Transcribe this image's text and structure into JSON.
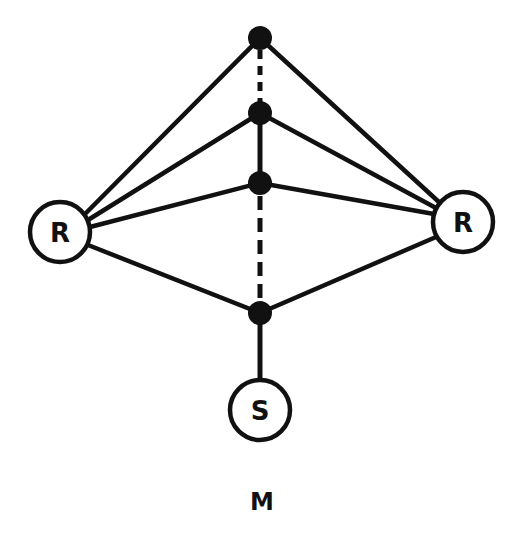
{
  "diagram": {
    "caption": "M",
    "stroke_color": "#111111",
    "background": "#ffffff",
    "circle_nodes": [
      {
        "id": "R_left",
        "label": "R",
        "cx": 60,
        "cy": 232,
        "r": 30
      },
      {
        "id": "R_right",
        "label": "R",
        "cx": 463,
        "cy": 222,
        "r": 30
      },
      {
        "id": "S",
        "label": "S",
        "cx": 260,
        "cy": 410,
        "r": 30
      }
    ],
    "dot_nodes": [
      {
        "id": "d1",
        "cx": 260,
        "cy": 38
      },
      {
        "id": "d2",
        "cx": 260,
        "cy": 113
      },
      {
        "id": "d3",
        "cx": 260,
        "cy": 183
      },
      {
        "id": "d4",
        "cx": 260,
        "cy": 313
      }
    ],
    "solid_edges": [
      [
        "R_left",
        "d1"
      ],
      [
        "R_left",
        "d2"
      ],
      [
        "R_left",
        "d3"
      ],
      [
        "R_left",
        "d4"
      ],
      [
        "R_right",
        "d1"
      ],
      [
        "R_right",
        "d2"
      ],
      [
        "R_right",
        "d3"
      ],
      [
        "R_right",
        "d4"
      ],
      [
        "d2",
        "d3"
      ],
      [
        "d4",
        "S"
      ]
    ],
    "dashed_edges": [
      [
        "d1",
        "d2"
      ],
      [
        "d3",
        "d4"
      ]
    ]
  }
}
